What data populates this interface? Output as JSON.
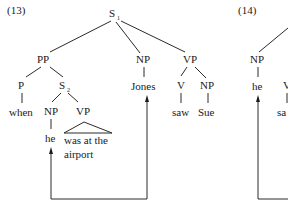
{
  "examples": [
    {
      "label": "(13)",
      "nodes": {
        "s1": {
          "cat": "S",
          "sub": "1"
        },
        "pp": {
          "cat": "PP"
        },
        "np_jones": {
          "cat": "NP"
        },
        "vp_main": {
          "cat": "VP"
        },
        "p": {
          "cat": "P"
        },
        "s2": {
          "cat": "S",
          "sub": "2"
        },
        "np_he": {
          "cat": "NP"
        },
        "vp_sub": {
          "cat": "VP"
        },
        "v": {
          "cat": "V"
        },
        "np_sue": {
          "cat": "NP"
        }
      },
      "leaves": {
        "when": "when",
        "he": "he",
        "vp_phrase_line1": "was at the",
        "vp_phrase_line2": "airport",
        "jones": "Jones",
        "saw": "saw",
        "sue": "Sue"
      },
      "coreference_arrow": {
        "from": "Jones",
        "to": "he"
      }
    },
    {
      "label": "(14)",
      "nodes": {
        "np": {
          "cat": "NP"
        },
        "v_partial": {
          "cat": "V"
        }
      },
      "leaves": {
        "he": "he",
        "saw_partial": "sa"
      }
    }
  ]
}
